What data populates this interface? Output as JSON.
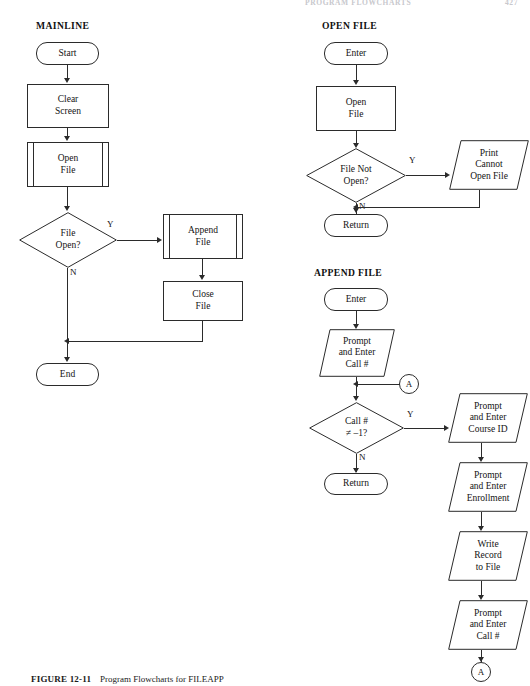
{
  "page": {
    "running_head": "PROGRAM FLOWCHARTS",
    "page_number": "427",
    "caption_label": "FIGURE 12-11",
    "caption_text": "Program Flowcharts for FILEAPP"
  },
  "sections": [
    {
      "id": "mainline",
      "title": "MAINLINE"
    },
    {
      "id": "openfile",
      "title": "OPEN FILE"
    },
    {
      "id": "appendfile",
      "title": "APPEND FILE"
    }
  ],
  "mainline": {
    "start": "Start",
    "clear_screen": {
      "l1": "Clear",
      "l2": "Screen"
    },
    "open_file": {
      "l1": "Open",
      "l2": "File"
    },
    "decision": {
      "l1": "File",
      "l2": "Open?"
    },
    "decision_yes": "Y",
    "decision_no": "N",
    "append_file": {
      "l1": "Append",
      "l2": "File"
    },
    "close_file": {
      "l1": "Close",
      "l2": "File"
    },
    "end": "End"
  },
  "openfile": {
    "enter": "Enter",
    "open_file": {
      "l1": "Open",
      "l2": "File"
    },
    "decision": {
      "l1": "File Not",
      "l2": "Open?"
    },
    "decision_yes": "Y",
    "decision_no": "N",
    "print_error": {
      "l1": "Print",
      "l2": "Cannot",
      "l3": "Open File"
    },
    "return": "Return"
  },
  "appendfile": {
    "enter": "Enter",
    "prompt_call": {
      "l1": "Prompt",
      "l2": "and Enter",
      "l3": "Call #"
    },
    "connector_in": "A",
    "decision": {
      "l1": "Call #",
      "l2": "≠ –1?"
    },
    "decision_yes": "Y",
    "decision_no": "N",
    "return": "Return",
    "prompt_course": {
      "l1": "Prompt",
      "l2": "and Enter",
      "l3": "Course ID"
    },
    "prompt_enroll": {
      "l1": "Prompt",
      "l2": "and Enter",
      "l3": "Enrollment"
    },
    "write_record": {
      "l1": "Write",
      "l2": "Record",
      "l3": "to File"
    },
    "prompt_call2": {
      "l1": "Prompt",
      "l2": "and Enter",
      "l3": "Call #"
    },
    "connector_out": "A"
  },
  "colors": {
    "stroke": "#2b2b2b",
    "text": "#141414",
    "background": "#ffffff"
  }
}
